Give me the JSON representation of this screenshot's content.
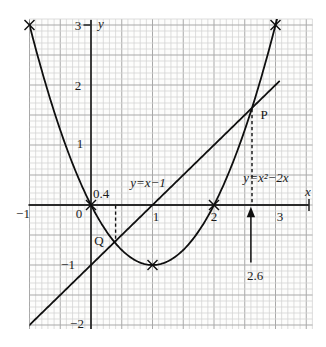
{
  "figure": {
    "background": "#ffffff",
    "paper_background": "#fdfdfc",
    "grid_minor_color": "#d4d4d4",
    "grid_major_color": "#a9a9a9",
    "axis_color": "#2b2b2b",
    "curve_color": "#0f0f0f",
    "text_color": "#1a1a1a"
  },
  "axis_labels": {
    "y_sym": "y",
    "x_sym": "x",
    "y3": "3",
    "y2": "2",
    "y1": "1",
    "y0": "0",
    "ym1": "−1",
    "ym2": "−2",
    "xm1": "−1",
    "x1": "1",
    "x2": "2",
    "x3": "3"
  },
  "annotations": {
    "p": "P",
    "q": "Q",
    "q_x": "0.4",
    "p_x": "2.6"
  },
  "equations": {
    "line": "y=x−1",
    "parabola": "y=x²−2x"
  },
  "chart_data": {
    "type": "line",
    "title": "",
    "xlabel": "x",
    "ylabel": "y",
    "xlim": [
      -1.03,
      3.64
    ],
    "ylim": [
      -2.07,
      3.1
    ],
    "x_ticks": [
      -1,
      0,
      1,
      2,
      3
    ],
    "y_ticks": [
      -2,
      -1,
      0,
      1,
      2,
      3
    ],
    "grid": {
      "style": "graph-paper",
      "minor_step": 0.1,
      "major_step": 0.5
    },
    "series": [
      {
        "name": "parabola",
        "equation": "y = x^2 - 2x",
        "label": "y=x²−2x",
        "x_range": [
          -1.06,
          3.1
        ],
        "marked_points": [
          [
            -1,
            3
          ],
          [
            0,
            0
          ],
          [
            1,
            -1
          ],
          [
            2,
            0
          ],
          [
            3,
            3
          ]
        ]
      },
      {
        "name": "line",
        "equation": "y = x - 1",
        "label": "y=x−1",
        "x_range": [
          -1.1,
          3.06
        ],
        "marked_points": []
      }
    ],
    "intersections": [
      {
        "name": "Q",
        "x": 0.382,
        "y": -0.618
      },
      {
        "name": "P",
        "x": 2.618,
        "y": 1.618
      }
    ],
    "drop_lines": [
      {
        "style": "dashed",
        "from": [
          0.4,
          -0.01
        ],
        "to": [
          0.4,
          -0.62
        ]
      },
      {
        "style": "dashed",
        "from": [
          2.618,
          1.6
        ],
        "to": [
          2.618,
          0.0
        ]
      }
    ],
    "arrow": {
      "x": 2.6,
      "y_tip": -0.03,
      "y_tail": -0.96,
      "label": "2.6"
    }
  }
}
